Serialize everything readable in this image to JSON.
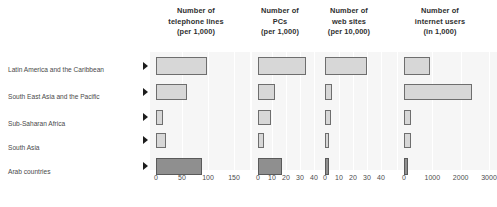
{
  "chart_data": {
    "type": "bar",
    "orientation": "horizontal",
    "title": "",
    "layout": "small-multiples",
    "categories": [
      "Latin America and the Caribbean",
      "South East Asia and the Pacific",
      "Sub-Saharan Africa",
      "South Asia",
      "Arab countries"
    ],
    "highlight_category": "Arab countries",
    "colors": {
      "bar_light": "#d7d7d7",
      "bar_dark": "#8f8f8f",
      "bar_border": "#6e6e6e",
      "panel_background": "#f6f6f6",
      "gridline": "#ffffff",
      "text": "#3b3b3b",
      "marker": "#1d1d1d"
    },
    "panels": [
      {
        "id": "telephone-lines",
        "title_lines": [
          "Number of",
          "telephone lines",
          "(per 1,000)"
        ],
        "xlabel": "",
        "ylabel": "",
        "xlim": [
          0,
          150
        ],
        "ticks": [
          0,
          50,
          100,
          150
        ],
        "tick_labels": [
          "0",
          "50",
          "100",
          "150"
        ],
        "values": [
          98,
          60,
          13,
          20,
          88
        ]
      },
      {
        "id": "pcs",
        "title_lines": [
          "Number of",
          "PCs",
          "(per 1,000)"
        ],
        "xlabel": "",
        "ylabel": "",
        "xlim": [
          0,
          40
        ],
        "ticks": [
          0,
          10,
          20,
          30,
          40
        ],
        "tick_labels": [
          "0",
          "10",
          "20",
          "30",
          "40"
        ],
        "values": [
          34,
          12,
          9,
          4,
          17
        ]
      },
      {
        "id": "web-sites",
        "title_lines": [
          "Number of",
          "web sites",
          "(per 10,000)"
        ],
        "xlabel": "",
        "ylabel": "",
        "xlim": [
          0,
          40
        ],
        "ticks": [
          0,
          10,
          20,
          30,
          40
        ],
        "tick_labels": [
          "0",
          "10",
          "20",
          "30",
          "40"
        ],
        "values": [
          30,
          5,
          4,
          3,
          3
        ]
      },
      {
        "id": "internet-users",
        "title_lines": [
          "Number of",
          "internet users",
          "(in 1,000)"
        ],
        "xlabel": "",
        "ylabel": "",
        "xlim": [
          0,
          3000
        ],
        "ticks": [
          0,
          1000,
          2000,
          3000
        ],
        "tick_labels": [
          "0",
          "1000",
          "2000",
          "3000"
        ],
        "values": [
          900,
          2400,
          230,
          260,
          150
        ]
      }
    ]
  }
}
